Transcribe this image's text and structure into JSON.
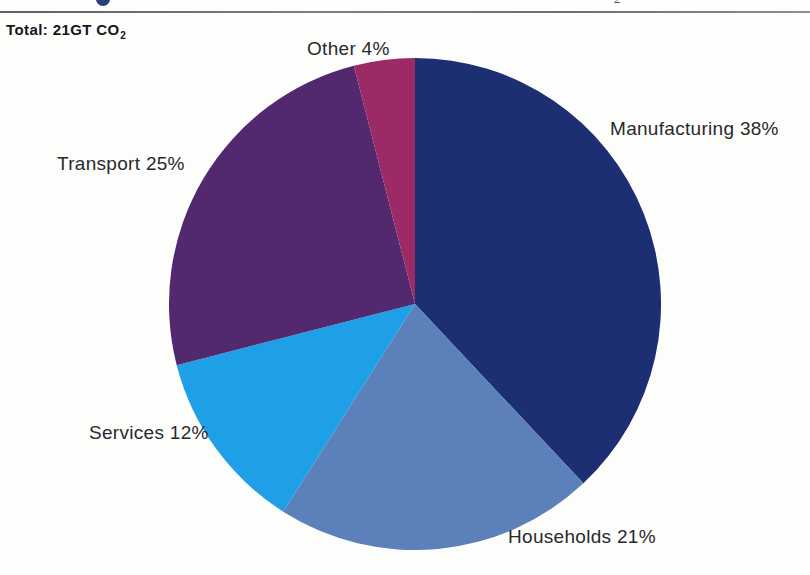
{
  "page": {
    "background_color": "#fdfdfc",
    "title_fragment_color": "#2a3f7a",
    "rule_color": "#6a6e7b",
    "subscript_fragment": "2"
  },
  "header": {
    "total_prefix": "Total: 21GT CO",
    "total_subscript": "2",
    "total_full": "Total: 21GT CO2"
  },
  "chart_data": {
    "type": "pie",
    "title": "Total: 21GT CO2",
    "unit": "%",
    "total_label": "21GT CO2",
    "start_angle_deg": 0,
    "direction": "clockwise",
    "categories": [
      "Manufacturing",
      "Households",
      "Services",
      "Transport",
      "Other"
    ],
    "values": [
      38,
      21,
      12,
      25,
      4
    ],
    "colors": [
      "#1c2f73",
      "#5b80ba",
      "#1f9fe5",
      "#52286f",
      "#9c2a67"
    ],
    "labels": [
      "Manufacturing 38%",
      "Households 21%",
      "Services 12%",
      "Transport 25%",
      "Other 4%"
    ],
    "legend": "none",
    "grid": false,
    "slices": [
      {
        "name": "Manufacturing",
        "value": 38,
        "label": "Manufacturing 38%",
        "color": "#1c2f73"
      },
      {
        "name": "Households",
        "value": 21,
        "label": "Households 21%",
        "color": "#5b80ba"
      },
      {
        "name": "Services",
        "value": 12,
        "label": "Services 12%",
        "color": "#1f9fe5"
      },
      {
        "name": "Transport",
        "value": 25,
        "label": "Transport 25%",
        "color": "#52286f"
      },
      {
        "name": "Other",
        "value": 4,
        "label": "Other 4%",
        "color": "#9c2a67"
      }
    ]
  }
}
